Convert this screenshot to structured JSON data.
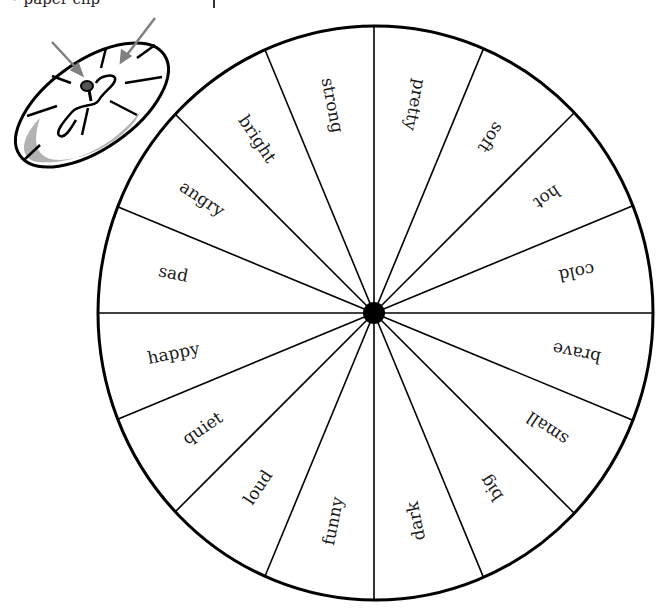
{
  "caption": {
    "text": "• paper clip"
  },
  "illustration": {
    "name": "spinner-with-paper-clip",
    "arrow_color": "#808080",
    "shadow_color": "#b3b3b3"
  },
  "wheel": {
    "segment_count": 16,
    "stroke_color": "#000000",
    "hub_color": "#000000",
    "labels_clockwise_from_top": [
      "pretty",
      "soft",
      "hot",
      "cold",
      "brave",
      "small",
      "big",
      "dark",
      "funny",
      "loud",
      "quiet",
      "happy",
      "sad",
      "angry",
      "bright",
      "strong"
    ]
  }
}
